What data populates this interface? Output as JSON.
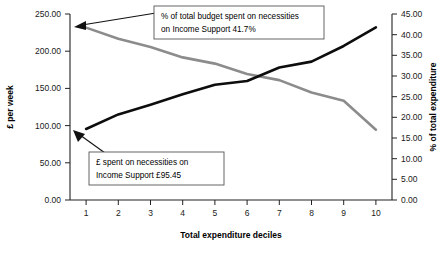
{
  "chart_data": {
    "type": "line",
    "title": "",
    "xlabel": "Total expenditure deciles",
    "ylabel": "£ per week",
    "y2label": "% of total expenditure",
    "categories": [
      "1",
      "2",
      "3",
      "4",
      "5",
      "6",
      "7",
      "8",
      "9",
      "10"
    ],
    "xtick_labels": [
      "1",
      "2",
      "3",
      "4",
      "5",
      "6",
      "7",
      "8",
      "9",
      "10"
    ],
    "ylim": [
      0,
      250
    ],
    "ytick_labels": [
      "0.00",
      "50.00",
      "100.00",
      "150.00",
      "200.00",
      "250.00"
    ],
    "ytick_values": [
      0,
      50,
      100,
      150,
      200,
      250
    ],
    "y2lim": [
      0,
      45
    ],
    "y2tick_labels": [
      "0.00",
      "5.00",
      "10.00",
      "15.00",
      "20.00",
      "25.00",
      "30.00",
      "35.00",
      "40.00",
      "45.00"
    ],
    "y2tick_values": [
      0,
      5,
      10,
      15,
      20,
      25,
      30,
      35,
      40,
      45
    ],
    "grid": false,
    "legend": "none",
    "series": [
      {
        "name": "£ spent on necessities",
        "axis": "left",
        "color": "#0d0d0d",
        "values": [
          95.45,
          115.0,
          128.0,
          142.0,
          155.0,
          160.0,
          178.0,
          186.0,
          207.0,
          232.0
        ]
      },
      {
        "name": "% of total budget spent on necessities",
        "axis": "right",
        "color": "#8c8c8c",
        "values": [
          41.7,
          39.0,
          37.0,
          34.5,
          33.0,
          30.5,
          29.0,
          26.0,
          24.0,
          17.0
        ]
      }
    ],
    "annotations": [
      {
        "id": "pct-callout",
        "lines": [
          "% of total budget spent on necessities",
          "on Income Support 41.7%"
        ],
        "points_to_series": "% of total budget spent on necessities",
        "points_to_index": 0
      },
      {
        "id": "gbp-callout",
        "lines": [
          "£ spent on necessities on",
          "Income Support £95.45"
        ],
        "points_to_series": "£ spent on necessities",
        "points_to_index": 0
      }
    ]
  },
  "colors": {
    "background": "#ffffff",
    "axis": "#222222",
    "series_black": "#0d0d0d",
    "series_gray": "#8c8c8c",
    "callout_border": "#555555",
    "text": "#000000"
  }
}
